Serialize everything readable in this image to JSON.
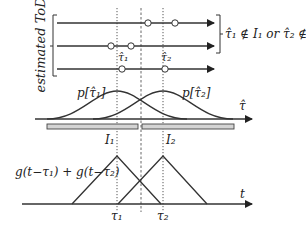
{
  "diagram": {
    "estimated_label": "estimated ToD",
    "condition_text": "τ̂₁ ∉ I₁ or τ̂₂ ∉ I₂",
    "tau_hat_1": "τ̂₁",
    "tau_hat_2": "τ̂₂",
    "p1": "p[τ̂₁]",
    "p2": "p[τ̂₂]",
    "tau_hat_axis": "τ̂",
    "interval_1": "I₁",
    "interval_2": "I₂",
    "g_label": "g(t−τ₁) + g(t−τ₂)",
    "t_axis": "t",
    "tau_1": "τ₁",
    "tau_2": "τ₂"
  },
  "estimate_lines": [
    {
      "y": 23,
      "circles_x": [
        148,
        175
      ]
    },
    {
      "y": 46,
      "circles_x": [
        111,
        131
      ]
    },
    {
      "y": 69,
      "circles_x": [
        122,
        165
      ]
    }
  ],
  "colors": {
    "line": "#333333",
    "bar_fill": "#d4d4d4"
  }
}
